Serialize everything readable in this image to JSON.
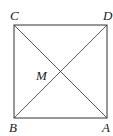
{
  "diagram": {
    "type": "geometry",
    "shape": "square",
    "stroke_color": "#333333",
    "vertices": {
      "C": {
        "label": "C",
        "x": 14,
        "y": 25
      },
      "D": {
        "label": "D",
        "x": 107,
        "y": 25
      },
      "B": {
        "label": "B",
        "x": 14,
        "y": 118
      },
      "A": {
        "label": "A",
        "x": 107,
        "y": 118
      }
    },
    "center": {
      "label": "M"
    },
    "diagonals": [
      "CA",
      "BD"
    ]
  }
}
